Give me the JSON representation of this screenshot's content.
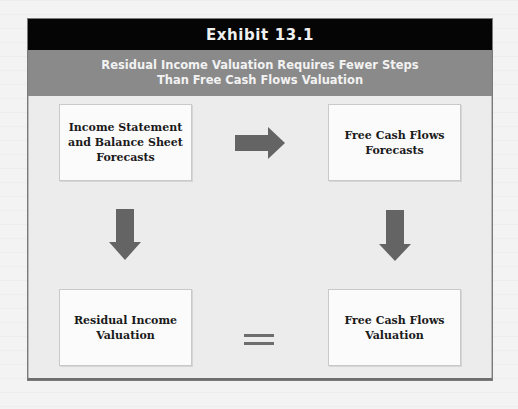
{
  "exhibit": {
    "label": "Exhibit 13.1",
    "subtitle_line1": "Residual Income Valuation Requires Fewer Steps",
    "subtitle_line2": "Than Free Cash Flows Valuation"
  },
  "nodes": {
    "top_left": {
      "lines": [
        "Income Statement",
        "and Balance Sheet",
        "Forecasts"
      ]
    },
    "top_right": {
      "lines": [
        "Free Cash Flows",
        "Forecasts"
      ]
    },
    "bottom_left": {
      "lines": [
        "Residual Income",
        "Valuation"
      ]
    },
    "bottom_right": {
      "lines": [
        "Free Cash Flows",
        "Valuation"
      ]
    }
  },
  "connectors": [
    {
      "from": "top_left",
      "to": "top_right",
      "type": "arrow-right"
    },
    {
      "from": "top_left",
      "to": "bottom_left",
      "type": "arrow-down"
    },
    {
      "from": "top_right",
      "to": "bottom_right",
      "type": "arrow-down"
    },
    {
      "from": "bottom_left",
      "to": "bottom_right",
      "type": "equals"
    }
  ],
  "colors": {
    "header_black": "#050505",
    "header_gray": "#8a8a8a",
    "arrow": "#646464",
    "panel": "#ececec",
    "box": "#fbfbfb"
  }
}
